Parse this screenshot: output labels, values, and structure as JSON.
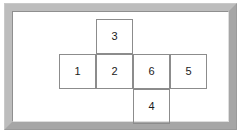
{
  "diagram": {
    "type": "cube-net",
    "frame": {
      "style": "beveled-grey-picture-frame",
      "border_color": "#b4b4b4",
      "inner_background": "#ffffff"
    },
    "grid": {
      "columns": 4,
      "rows": 3,
      "cell_width": 37,
      "cell_height": 35,
      "line_color": "#8c8c8c",
      "text_color": "#1a1a1a"
    },
    "cells": [
      {
        "label": "3",
        "col": 2,
        "row": 1,
        "x": 91,
        "y": 15,
        "w": 37,
        "h": 35
      },
      {
        "label": "1",
        "col": 1,
        "row": 2,
        "x": 54,
        "y": 50,
        "w": 37,
        "h": 35
      },
      {
        "label": "2",
        "col": 2,
        "row": 2,
        "x": 91,
        "y": 50,
        "w": 37,
        "h": 35
      },
      {
        "label": "6",
        "col": 3,
        "row": 2,
        "x": 128,
        "y": 50,
        "w": 37,
        "h": 35
      },
      {
        "label": "5",
        "col": 4,
        "row": 2,
        "x": 165,
        "y": 50,
        "w": 37,
        "h": 35
      },
      {
        "label": "4",
        "col": 3,
        "row": 3,
        "x": 128,
        "y": 85,
        "w": 37,
        "h": 35
      }
    ]
  }
}
